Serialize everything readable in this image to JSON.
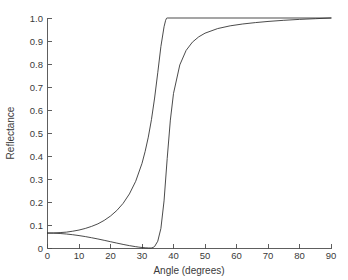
{
  "chart_data": {
    "type": "line",
    "title": "",
    "xlabel": "Angle (degrees)",
    "ylabel": "Reflectance",
    "xlim": [
      0,
      90
    ],
    "ylim": [
      0,
      1.0
    ],
    "grid": false,
    "legend": "none",
    "xticks": [
      0,
      10,
      20,
      30,
      40,
      50,
      60,
      70,
      80,
      90
    ],
    "xtick_labels": [
      "0",
      "10",
      "20",
      "30",
      "40",
      "50",
      "60",
      "70",
      "80",
      "90"
    ],
    "yticks": [
      0,
      0.1,
      0.2,
      0.3,
      0.4,
      0.5,
      0.6,
      0.7,
      0.8,
      0.9,
      1.0
    ],
    "ytick_labels": [
      "0",
      "0.1",
      "0.2",
      "0.3",
      "0.4",
      "0.5",
      "0.6",
      "0.7",
      "0.8",
      "0.9",
      "1.0"
    ],
    "series": [
      {
        "name": "s-polarized",
        "color": "#2b2b2b",
        "x": [
          0,
          2,
          4,
          6,
          8,
          10,
          12,
          14,
          16,
          18,
          20,
          22,
          24,
          26,
          28,
          30,
          31,
          32,
          33,
          34,
          35,
          36,
          37,
          37.5,
          37.8,
          38.0,
          38.0,
          90
        ],
        "values": [
          0.065,
          0.0655,
          0.067,
          0.069,
          0.073,
          0.078,
          0.085,
          0.094,
          0.105,
          0.12,
          0.139,
          0.163,
          0.194,
          0.235,
          0.29,
          0.368,
          0.42,
          0.482,
          0.558,
          0.652,
          0.762,
          0.876,
          0.962,
          0.99,
          0.999,
          1.0,
          1.0,
          1.0
        ]
      },
      {
        "name": "p-polarized",
        "color": "#2b2b2b",
        "x": [
          0,
          2,
          4,
          6,
          8,
          10,
          12,
          14,
          16,
          18,
          20,
          22,
          24,
          26,
          28,
          29,
          30,
          31,
          32,
          32.6,
          33,
          33.5,
          34,
          35,
          36,
          37,
          38,
          39,
          40,
          42,
          44,
          46,
          48,
          50,
          54,
          58,
          62,
          66,
          70,
          75,
          80,
          85,
          90
        ],
        "values": [
          0.065,
          0.0645,
          0.063,
          0.0608,
          0.0578,
          0.054,
          0.0496,
          0.0446,
          0.0392,
          0.0334,
          0.0274,
          0.0214,
          0.0156,
          0.0103,
          0.0058,
          0.0038,
          0.0022,
          0.0009,
          0.0001,
          0.0,
          0.0004,
          0.0022,
          0.0065,
          0.0295,
          0.085,
          0.205,
          0.389,
          0.556,
          0.672,
          0.796,
          0.859,
          0.895,
          0.918,
          0.934,
          0.954,
          0.966,
          0.974,
          0.98,
          0.985,
          0.99,
          0.994,
          0.997,
          1.0
        ]
      }
    ]
  },
  "axes": {
    "y_axis_title": "Reflectance",
    "x_axis_title": "Angle (degrees)"
  }
}
